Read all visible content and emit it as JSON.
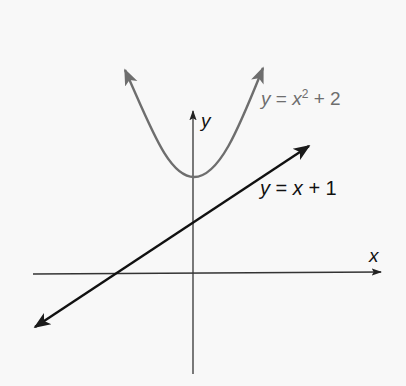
{
  "diagram": {
    "type": "coordinate-plane-graph",
    "axes": {
      "x_label": "x",
      "y_label": "y",
      "color": "#222222"
    },
    "curves": [
      {
        "name": "parabola",
        "equation_lhs": "y",
        "equation_eq": "=",
        "equation_var": "x",
        "equation_exp": "2",
        "equation_rest": "+ 2",
        "full": "y = x^2 + 2",
        "color": "#6e6e6e"
      },
      {
        "name": "line",
        "equation_lhs": "y",
        "equation_eq": "=",
        "equation_var": "x",
        "equation_rest": "+ 1",
        "full": "y = x + 1",
        "color": "#111111"
      }
    ],
    "background": "#f8f8f8"
  }
}
